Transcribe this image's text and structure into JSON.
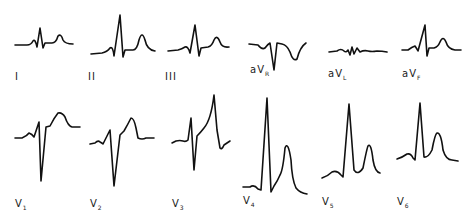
{
  "figure": {
    "stroke_color": "#111111",
    "background": "#ffffff"
  },
  "limb_leads": [
    {
      "label": "I",
      "sub": ""
    },
    {
      "label": "II",
      "sub": ""
    },
    {
      "label": "III",
      "sub": ""
    },
    {
      "label": "aV",
      "sub": "R"
    },
    {
      "label": "aV",
      "sub": "L"
    },
    {
      "label": "aV",
      "sub": "F"
    }
  ],
  "precordial_leads": [
    {
      "label": "V",
      "sub": "1"
    },
    {
      "label": "V",
      "sub": "2"
    },
    {
      "label": "V",
      "sub": "3"
    },
    {
      "label": "V",
      "sub": "4"
    },
    {
      "label": "V",
      "sub": "5"
    },
    {
      "label": "V",
      "sub": "6"
    }
  ]
}
